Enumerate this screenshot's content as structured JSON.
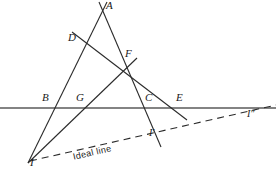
{
  "figure": {
    "width": 276,
    "height": 173,
    "background": "#ffffff",
    "stroke_color": "#2b2b2b",
    "horizon_color": "#5a5a5a",
    "label_color": "#1a1a1a"
  },
  "points": [
    {
      "id": "A",
      "label": "A",
      "x": 104,
      "y": 6,
      "label_x": 108,
      "label_y": 2
    },
    {
      "id": "D",
      "label": "D",
      "x": 80,
      "y": 41,
      "label_x": 70,
      "label_y": 34
    },
    {
      "id": "F",
      "label": "F",
      "x": 130,
      "y": 68,
      "label_x": 126,
      "label_y": 51
    },
    {
      "id": "B",
      "label": "B",
      "x": 54,
      "y": 108,
      "label_x": 44,
      "label_y": 93
    },
    {
      "id": "G",
      "label": "G",
      "x": 85,
      "y": 108,
      "label_x": 78,
      "label_y": 93
    },
    {
      "id": "C",
      "label": "C",
      "x": 152,
      "y": 108,
      "label_x": 146,
      "label_y": 93
    },
    {
      "id": "E",
      "label": "E",
      "x": 181,
      "y": 108,
      "label_x": 177,
      "label_y": 93
    },
    {
      "id": "I",
      "label": "I",
      "x": 31,
      "y": 160,
      "label_x": 29,
      "label_y": 159
    },
    {
      "id": "I1",
      "label": "I'",
      "x": 157,
      "y": 139,
      "label_x": 150,
      "label_y": 131
    },
    {
      "id": "I2",
      "label": "I″",
      "x": 253,
      "y": 115,
      "label_x": 248,
      "label_y": 111
    }
  ],
  "lines": [
    {
      "id": "line-I-B-D-A",
      "from": "I",
      "to": "A",
      "x1": 28,
      "y1": 163,
      "x2": 107,
      "y2": 2,
      "style": "solid"
    },
    {
      "id": "line-A-F-C-I1",
      "from": "A",
      "to": "I1",
      "x1": 99,
      "y1": 2,
      "x2": 160,
      "y2": 146,
      "style": "solid"
    },
    {
      "id": "line-I-G-F-top",
      "from": "I",
      "to": "F-upper",
      "x1": 28,
      "y1": 163,
      "x2": 136,
      "y2": 59,
      "style": "solid"
    },
    {
      "id": "line-D-F-E",
      "from": "D",
      "to": "E-below",
      "x1": 73,
      "y1": 33,
      "x2": 186,
      "y2": 119,
      "style": "solid"
    },
    {
      "id": "line-horizon",
      "from": "left-edge",
      "to": "right-edge",
      "x1": 0,
      "y1": 108,
      "x2": 276,
      "y2": 108,
      "style": "solid-thick"
    },
    {
      "id": "line-ideal",
      "from": "I",
      "to": "I2",
      "x1": 30,
      "y1": 161,
      "x2": 276,
      "y2": 105,
      "style": "dashed"
    }
  ],
  "annotations": {
    "ideal_line_label": "Ideal line",
    "ideal_label_x": 72,
    "ideal_label_y": 158,
    "ideal_label_rotation": -13
  }
}
